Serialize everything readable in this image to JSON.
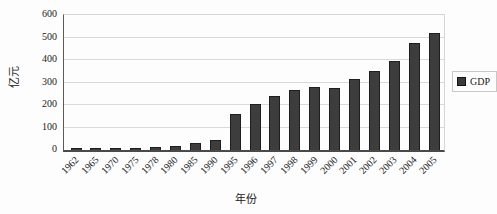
{
  "colors": {
    "background": "#fdfdfd",
    "bar_fill": "#3d3d3d",
    "bar_border": "#1e1e1e",
    "gridline": "#dadada",
    "axis_line": "#4a4a4a",
    "text": "#1a1a1a",
    "legend_border": "#c8c8c8"
  },
  "chart_data": {
    "type": "bar",
    "title": "",
    "xlabel": "年份",
    "ylabel": "亿元",
    "categories": [
      "1962",
      "1965",
      "1970",
      "1975",
      "1978",
      "1980",
      "1985",
      "1990",
      "1995",
      "1996",
      "1997",
      "1998",
      "1999",
      "2000",
      "2001",
      "2002",
      "2003",
      "2004",
      "2005"
    ],
    "series": [
      {
        "name": "GDP",
        "values": [
          5,
          5,
          7,
          10,
          13,
          16,
          30,
          45,
          160,
          205,
          238,
          265,
          280,
          275,
          315,
          350,
          395,
          475,
          520
        ]
      }
    ],
    "ylim": [
      0,
      600
    ],
    "yticks": [
      0,
      100,
      200,
      300,
      400,
      500,
      600
    ],
    "grid": true,
    "legend_position": "right"
  },
  "legend": {
    "gdp_label": "GDP"
  }
}
